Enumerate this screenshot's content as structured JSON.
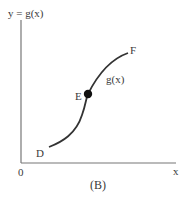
{
  "figure": {
    "caption": "(B)",
    "y_axis_label": "y = g(x)",
    "x_axis_label": "x",
    "origin_label": "0",
    "curve_label": "g(x)",
    "points": [
      {
        "name": "D",
        "role": "start"
      },
      {
        "name": "E",
        "role": "marked point (filled dot)"
      },
      {
        "name": "F",
        "role": "end"
      }
    ],
    "colors": {
      "axis": "#666666",
      "curve": "#333333",
      "dot": "#111111"
    }
  }
}
